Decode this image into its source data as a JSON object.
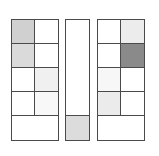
{
  "panels": [
    {
      "id": "left",
      "rows": [
        {
          "cells": [
            "#d0d0d0",
            "#ffffff"
          ]
        },
        {
          "cells": [
            "#dadada",
            "#ffffff"
          ]
        },
        {
          "cells": [
            "#ffffff",
            "#f0f0f0"
          ]
        },
        {
          "cells": [
            "#ffffff",
            "#f8f8f8"
          ]
        },
        {
          "cells": [
            "#ffffff"
          ],
          "span": 2
        }
      ]
    },
    {
      "id": "mid",
      "rows": [
        {
          "cells": [
            "#ffffff"
          ],
          "rowspan": 4
        },
        {
          "cells": [
            "#dcdcdc"
          ]
        }
      ]
    },
    {
      "id": "right",
      "rows": [
        {
          "cells": [
            "#ffffff",
            "#ececec"
          ]
        },
        {
          "cells": [
            "#ffffff",
            "#8a8a8a"
          ]
        },
        {
          "cells": [
            "#f7f7f7",
            "#ffffff"
          ]
        },
        {
          "cells": [
            "#ebebeb",
            "#ffffff"
          ]
        },
        {
          "cells": [
            "#ffffff"
          ],
          "span": 2
        }
      ]
    }
  ],
  "colors": {
    "border": "#4a4a4a",
    "background": "#ffffff"
  }
}
